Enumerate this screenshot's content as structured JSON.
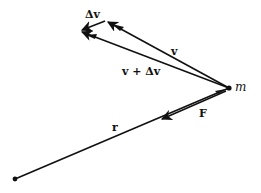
{
  "diagram": {
    "type": "vector-diagram",
    "colors": {
      "ink": "#111111",
      "background": "#ffffff"
    },
    "points": {
      "origin": {
        "x": 15,
        "y": 179
      },
      "mass": {
        "x": 229,
        "y": 88
      },
      "v_tip": {
        "x": 105,
        "y": 21
      },
      "v_plus_dv_tip": {
        "x": 80,
        "y": 31
      }
    },
    "labels": {
      "delta_v": "Δv",
      "v": "v",
      "v_plus_delta_v": "v + Δv",
      "mass": "m",
      "force": "F",
      "radius": "r"
    },
    "vectors": [
      {
        "name": "v",
        "from": "mass",
        "to": "v_tip"
      },
      {
        "name": "v + Δv",
        "from": "mass",
        "to": "v_plus_dv_tip"
      },
      {
        "name": "Δv",
        "from": "v_tip",
        "to": "v_plus_dv_tip"
      },
      {
        "name": "F",
        "from": "mass",
        "direction": "toward origin"
      },
      {
        "name": "r",
        "from": "origin",
        "to": "mass"
      }
    ]
  }
}
